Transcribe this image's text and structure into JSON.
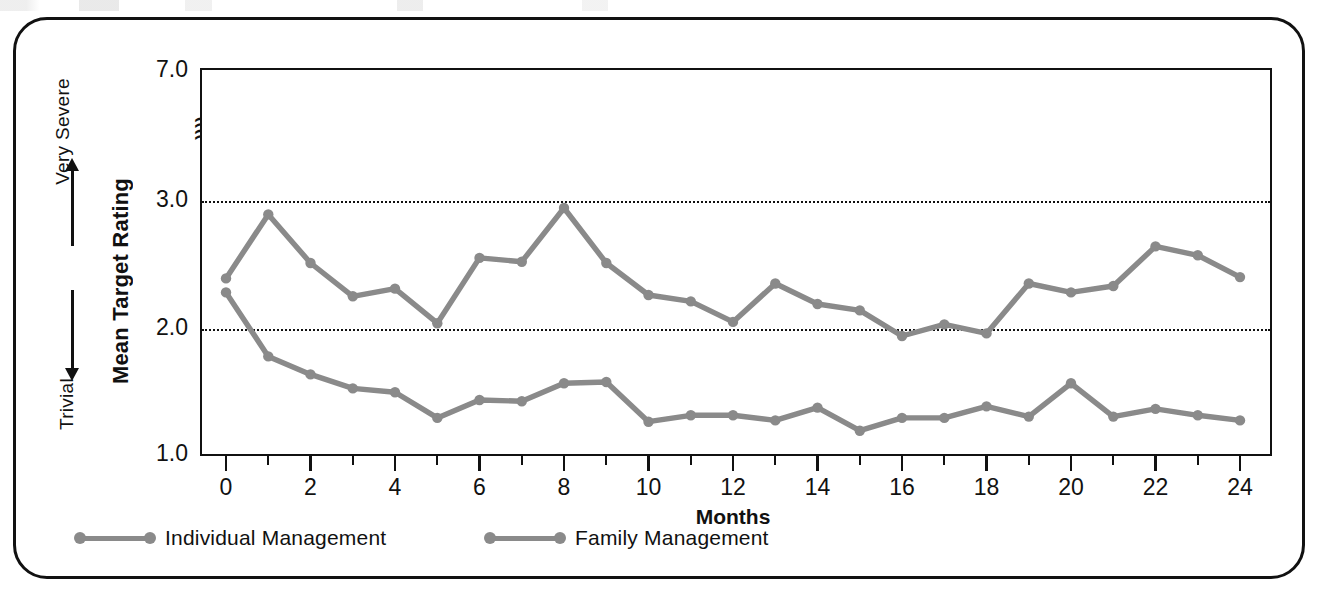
{
  "figure": {
    "severity_top_label": "Very\nSevere",
    "severity_bottom_label": "Trivial",
    "y_axis_title": "Mean Target Rating",
    "x_axis_title": "Months",
    "axis_break_symbol": "≈"
  },
  "legend": {
    "items": [
      {
        "label": "Individual Management",
        "color": "#8a8a8a"
      },
      {
        "label": "Family Management",
        "color": "#8a8a8a"
      }
    ]
  },
  "axes": {
    "y_tick_labels": [
      "7.0",
      "3.0",
      "2.0",
      "1.0"
    ],
    "x_tick_labels": [
      "0",
      "2",
      "4",
      "6",
      "8",
      "10",
      "12",
      "14",
      "16",
      "18",
      "20",
      "22",
      "24"
    ]
  },
  "chart_data": {
    "type": "line",
    "title": "",
    "xlabel": "Months",
    "ylabel": "Mean Target Rating",
    "xlim": [
      0,
      24
    ],
    "ylim": [
      1.0,
      3.2
    ],
    "y_axis_broken": true,
    "y_axis_break_top_value": 7.0,
    "y_tick_values": [
      1.0,
      2.0,
      3.0,
      7.0
    ],
    "x": [
      0,
      1,
      2,
      3,
      4,
      5,
      6,
      7,
      8,
      9,
      10,
      11,
      12,
      13,
      14,
      15,
      16,
      17,
      18,
      19,
      20,
      21,
      22,
      23,
      24
    ],
    "grid": "horizontal-dotted-at-2.0-and-3.0",
    "legend_position": "below-axes",
    "series": [
      {
        "name": "Family Management",
        "color": "#8a8a8a",
        "values": [
          2.38,
          2.88,
          2.5,
          2.24,
          2.3,
          2.03,
          2.54,
          2.51,
          2.93,
          2.5,
          2.25,
          2.2,
          2.04,
          2.34,
          2.18,
          2.13,
          1.93,
          2.02,
          1.95,
          2.34,
          2.27,
          2.32,
          2.63,
          2.56,
          2.39
        ]
      },
      {
        "name": "Individual Management",
        "color": "#8a8a8a",
        "values": [
          2.27,
          1.77,
          1.63,
          1.52,
          1.49,
          1.29,
          1.43,
          1.42,
          1.56,
          1.57,
          1.26,
          1.31,
          1.31,
          1.27,
          1.37,
          1.19,
          1.29,
          1.29,
          1.38,
          1.3,
          1.56,
          1.3,
          1.36,
          1.31,
          1.27
        ]
      }
    ]
  }
}
